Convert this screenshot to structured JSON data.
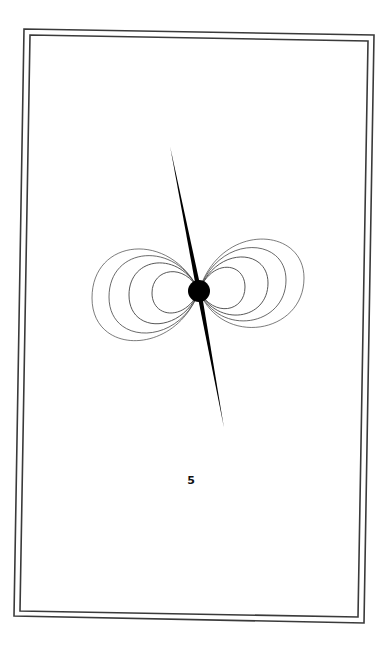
{
  "page": {
    "number": "5"
  },
  "frame": {
    "outer_border_color": "#3a3a3a",
    "inner_border_color": "#3a3a3a"
  },
  "illustration": {
    "subject": "magnetic-dipole-field-lines",
    "center_dot_color": "#000000",
    "spike_color": "#000000",
    "field_line_color": "#444444",
    "loops_per_side": 4
  }
}
